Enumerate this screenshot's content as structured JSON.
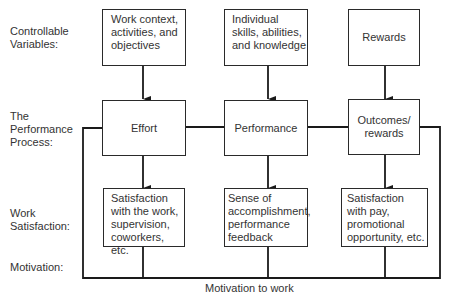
{
  "row_labels": {
    "controllable": "Controllable\nVariables:",
    "process": "The\nPerformance\nProcess:",
    "satisfaction": "Work\nSatisfaction:",
    "motivation": "Motivation:"
  },
  "controllable_variables": [
    {
      "label": "Work context,\nactivities, and\nobjectives"
    },
    {
      "label": "Individual\nskills, abilities,\nand knowledge"
    },
    {
      "label": "Rewards"
    }
  ],
  "performance_process": [
    {
      "label": "Effort"
    },
    {
      "label": "Performance"
    },
    {
      "label": "Outcomes/\nrewards"
    }
  ],
  "work_satisfaction": [
    {
      "label": "Satisfaction\nwith the work,\nsupervision,\ncoworkers, etc."
    },
    {
      "label": "Sense of\naccomplishment,\nperformance\nfeedback"
    },
    {
      "label": "Satisfaction\nwith pay,\npromotional\nopportunity, etc."
    }
  ],
  "motivation_caption": "Motivation to work"
}
